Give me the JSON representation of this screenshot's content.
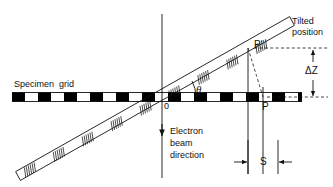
{
  "figure": {
    "kind": "technical-diagram",
    "width": 333,
    "height": 187,
    "background_color": "#ffffff",
    "line_color": "#111111",
    "grid_fill_color": "#000000"
  },
  "labels": {
    "specimen_grid": "Specimen  grid",
    "tilted_position_line1": "Tilted",
    "tilted_position_line2": "position",
    "electron_beam_line1": "Electron",
    "electron_beam_line2": "beam",
    "electron_beam_line3": "direction",
    "origin": "0",
    "theta": "θ",
    "delta_z": "ΔZ",
    "shift_s": "S",
    "point_p": "P",
    "point_p_prime": "P'"
  },
  "geometry": {
    "grid_line_y": 97,
    "grid_left_x": 12,
    "grid_right_x": 302,
    "grid_bar_height": 9,
    "grid_segment_width": 13,
    "grid_gap_width": 13,
    "origin_x": 162,
    "beam_axis_x": 162,
    "beam_top_y": 14,
    "beam_bottom_y": 178,
    "tilt_angle_degrees": 28,
    "rod_start_x": 18,
    "rod_start_y": 176,
    "rod_end_x": 292,
    "rod_end_y": 21,
    "rod_half_width": 5,
    "p_prime_x": 248,
    "p_prime_y": 48,
    "p_x": 263,
    "p_y": 97,
    "delta_z_arrow_x": 313,
    "delta_z_top_y": 48,
    "delta_z_bottom_y": 97,
    "s_measure_y": 162,
    "s_left_x": 248,
    "s_right_x": 278,
    "hatch_band_count": 9
  }
}
